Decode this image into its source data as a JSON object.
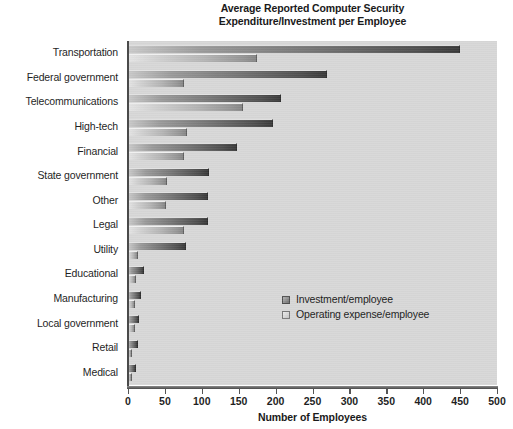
{
  "chart_data": {
    "type": "bar",
    "orientation": "horizontal",
    "title": "Average Reported Computer Security Expenditure/Investment per Employee",
    "title_lines": [
      "Average Reported Computer Security",
      "Expenditure/Investment per Employee"
    ],
    "xlabel": "Number of Employees",
    "ylabel": "",
    "xlim": [
      0,
      500
    ],
    "xticks": [
      0,
      50,
      100,
      150,
      200,
      250,
      300,
      350,
      400,
      450,
      500
    ],
    "xtick_labels": [
      "0",
      "50",
      "100",
      "150",
      "200",
      "250",
      "300",
      "350",
      "400",
      "450",
      "500"
    ],
    "grid": false,
    "legend_position": "center-right-inside",
    "categories": [
      "Transportation",
      "Federal government",
      "Telecommunications",
      "High-tech",
      "Financial",
      "State government",
      "Other",
      "Legal",
      "Utility",
      "Educational",
      "Manufacturing",
      "Local government",
      "Retail",
      "Medical"
    ],
    "series": [
      {
        "name": "Investment/employee",
        "color": "#5a5a5a",
        "values": [
          450,
          270,
          207,
          196,
          148,
          110,
          108,
          108,
          79,
          22,
          18,
          15,
          13,
          11
        ]
      },
      {
        "name": "Operating expense/employee",
        "color": "#bdbdbd",
        "values": [
          175,
          76,
          156,
          80,
          76,
          53,
          52,
          76,
          14,
          11,
          10,
          9,
          6,
          6
        ]
      }
    ]
  },
  "legend": {
    "entries": [
      {
        "label": "Investment/employee"
      },
      {
        "label": "Operating expense/employee"
      }
    ]
  },
  "colors": {
    "plot_background": "#d7d7d7",
    "page_background": "#ffffff",
    "axis": "#4a4a4a",
    "text": "#1a1a1a"
  }
}
